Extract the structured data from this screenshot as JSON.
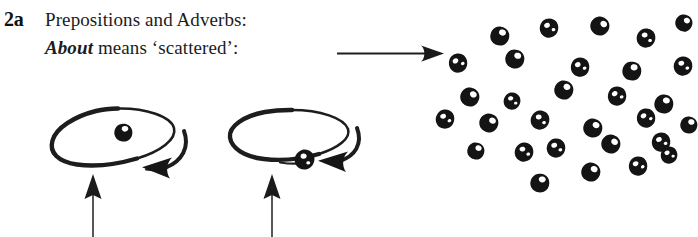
{
  "page": {
    "background_color": "#ffffff",
    "ink_color": "#1a1a1a",
    "width": 698,
    "height": 237
  },
  "text": {
    "item_number": "2a",
    "heading": "Prepositions and Adverbs:",
    "definition_keyword": "About",
    "definition_rest": " means ‘scattered’:"
  },
  "arrows": {
    "pointer_to_scatter": {
      "name": "scattered-pointer-arrow",
      "direction": "right",
      "x1": 337,
      "y1": 53,
      "x2": 444,
      "y2": 53
    },
    "callout_left": {
      "name": "callout-arrow-left-orbit",
      "direction": "up",
      "x": 93,
      "y_top": 176,
      "y_bottom": 237
    },
    "callout_right": {
      "name": "callout-arrow-right-orbit",
      "direction": "up",
      "x": 272,
      "y_top": 176,
      "y_bottom": 237
    }
  },
  "orbits": [
    {
      "name": "orbit-diagram-1",
      "label": "dot inside circle",
      "cx": 113,
      "cy": 140,
      "rx": 61,
      "ry": 32,
      "dot": {
        "cx": 124,
        "cy": 133,
        "r": 9,
        "position": "inside-center"
      },
      "rotation_arrow_direction": "counterclockwise"
    },
    {
      "name": "orbit-diagram-2",
      "label": "dot on circle rim",
      "cx": 288,
      "cy": 138,
      "rx": 61,
      "ry": 29,
      "dot": {
        "cx": 305,
        "cy": 160,
        "r": 10,
        "position": "on-rim-bottom"
      },
      "rotation_arrow_direction": "counterclockwise"
    }
  ],
  "scatter": {
    "name": "scattered-dots-cluster",
    "count": 30,
    "dot_color": "#141414",
    "highlight_color": "#ffffff",
    "bounds": {
      "x": 440,
      "y": 18,
      "width": 258,
      "height": 185
    },
    "dots": [
      {
        "cx": 500,
        "cy": 36,
        "r": 10,
        "rot": 14
      },
      {
        "cx": 549,
        "cy": 28,
        "r": 10,
        "rot": -22
      },
      {
        "cx": 600,
        "cy": 26,
        "r": 10,
        "rot": 40
      },
      {
        "cx": 646,
        "cy": 38,
        "r": 10,
        "rot": -10
      },
      {
        "cx": 684,
        "cy": 23,
        "r": 9,
        "rot": 28
      },
      {
        "cx": 458,
        "cy": 63,
        "r": 10,
        "rot": -35
      },
      {
        "cx": 515,
        "cy": 59,
        "r": 10,
        "rot": 18
      },
      {
        "cx": 580,
        "cy": 67,
        "r": 10,
        "rot": -28
      },
      {
        "cx": 632,
        "cy": 71,
        "r": 10,
        "rot": 8
      },
      {
        "cx": 683,
        "cy": 66,
        "r": 10,
        "rot": -16
      },
      {
        "cx": 470,
        "cy": 97,
        "r": 10,
        "rot": 30
      },
      {
        "cx": 512,
        "cy": 101,
        "r": 9,
        "rot": -12
      },
      {
        "cx": 564,
        "cy": 90,
        "r": 10,
        "rot": 22
      },
      {
        "cx": 617,
        "cy": 96,
        "r": 10,
        "rot": -30
      },
      {
        "cx": 664,
        "cy": 104,
        "r": 10,
        "rot": 12
      },
      {
        "cx": 445,
        "cy": 119,
        "r": 10,
        "rot": -20
      },
      {
        "cx": 489,
        "cy": 123,
        "r": 10,
        "rot": 34
      },
      {
        "cx": 540,
        "cy": 120,
        "r": 10,
        "rot": -8
      },
      {
        "cx": 593,
        "cy": 128,
        "r": 10,
        "rot": 24
      },
      {
        "cx": 646,
        "cy": 118,
        "r": 10,
        "rot": -34
      },
      {
        "cx": 689,
        "cy": 125,
        "r": 9,
        "rot": 16
      },
      {
        "cx": 556,
        "cy": 148,
        "r": 10,
        "rot": -18
      },
      {
        "cx": 611,
        "cy": 144,
        "r": 10,
        "rot": 36
      },
      {
        "cx": 661,
        "cy": 142,
        "r": 10,
        "rot": -24
      },
      {
        "cx": 476,
        "cy": 151,
        "r": 9,
        "rot": 20
      },
      {
        "cx": 524,
        "cy": 152,
        "r": 10,
        "rot": -14
      },
      {
        "cx": 591,
        "cy": 172,
        "r": 10,
        "rot": 26
      },
      {
        "cx": 638,
        "cy": 166,
        "r": 10,
        "rot": -32
      },
      {
        "cx": 540,
        "cy": 183,
        "r": 10,
        "rot": 10
      },
      {
        "cx": 669,
        "cy": 155,
        "r": 9,
        "rot": -26
      }
    ]
  }
}
